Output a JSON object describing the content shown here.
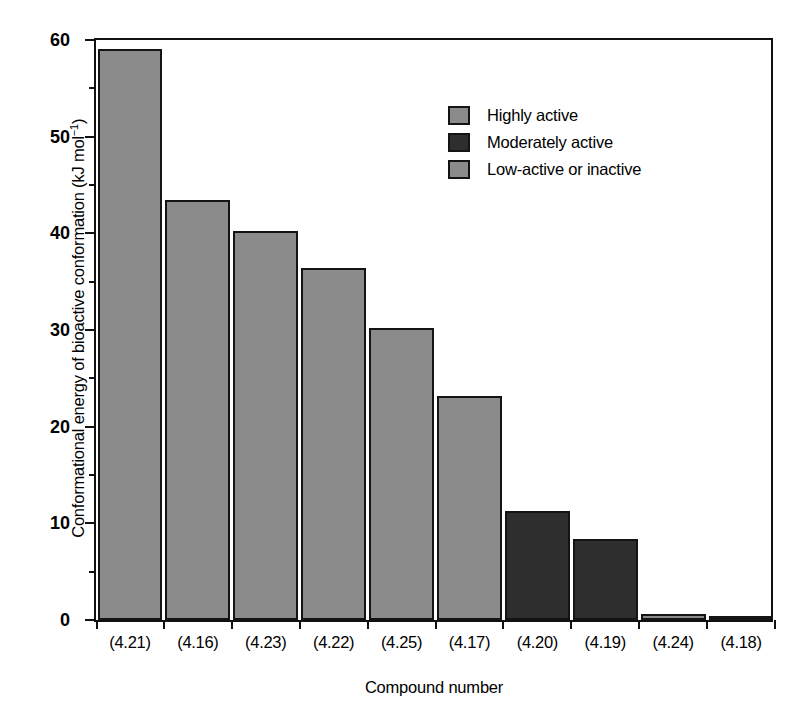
{
  "chart_data": {
    "type": "bar",
    "title": "",
    "xlabel": "Compound number",
    "ylabel": "Conformational energy of bioactive conformation (kJ mol⁻¹)",
    "ylabel_main": "Conformational energy of bioactive conformation (kJ mol",
    "ylabel_sup": "−1",
    "ylabel_tail": ")",
    "categories": [
      "(4.21)",
      "(4.16)",
      "(4.23)",
      "(4.22)",
      "(4.25)",
      "(4.17)",
      "(4.20)",
      "(4.19)",
      "(4.24)",
      "(4.18)"
    ],
    "values": [
      58.7,
      43.2,
      40.0,
      36.2,
      30.0,
      23.0,
      11.2,
      8.3,
      0.6,
      0.3
    ],
    "groups": [
      "Highly active",
      "Highly active",
      "Highly active",
      "Highly active",
      "Highly active",
      "Highly active",
      "Moderately active",
      "Moderately active",
      "Low-active or inactive",
      "Low-active or inactive"
    ],
    "ylim": [
      0,
      60
    ],
    "ytick_major": [
      0,
      10,
      20,
      30,
      40,
      50,
      60
    ],
    "ytick_minor": [
      5,
      15,
      25,
      35,
      45,
      55
    ],
    "ytick_labels": [
      "0",
      "10",
      "20",
      "30",
      "40",
      "50",
      "60"
    ],
    "grid": false,
    "legend_position": "upper right"
  },
  "legend": {
    "items": [
      {
        "label": "Highly active",
        "color": "#8b8b8b"
      },
      {
        "label": "Moderately active",
        "color": "#2e2e2e"
      },
      {
        "label": "Low-active or inactive",
        "color": "#8b8b8b"
      }
    ]
  },
  "colors": {
    "highly_active": "#8b8b8b",
    "moderately_active": "#2e2e2e",
    "low_active": "#8b8b8b",
    "axis": "#111111",
    "background": "#ffffff"
  }
}
